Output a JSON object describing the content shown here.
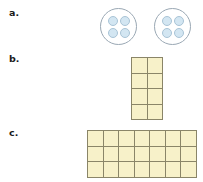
{
  "page": {
    "background_color": "#ffffff",
    "cutoff_text": ""
  },
  "items": [
    {
      "label": "a.",
      "type": "circle-groups",
      "group_count": 2,
      "dots_per_group": 4,
      "dot_fill_color": "#d3e6f2",
      "dot_border_color": "#a9c4d6",
      "circle_border_color": "#9aa8b4"
    },
    {
      "label": "b.",
      "type": "array-grid",
      "rows": 4,
      "columns": 2,
      "total_cells": 8,
      "cell_fill_color": "#f7f1c9",
      "cell_border_color": "#8a8568"
    },
    {
      "label": "c.",
      "type": "array-grid",
      "rows": 3,
      "columns": 7,
      "total_cells": 21,
      "cell_fill_color": "#f7f1c9",
      "cell_border_color": "#8a8568"
    }
  ]
}
